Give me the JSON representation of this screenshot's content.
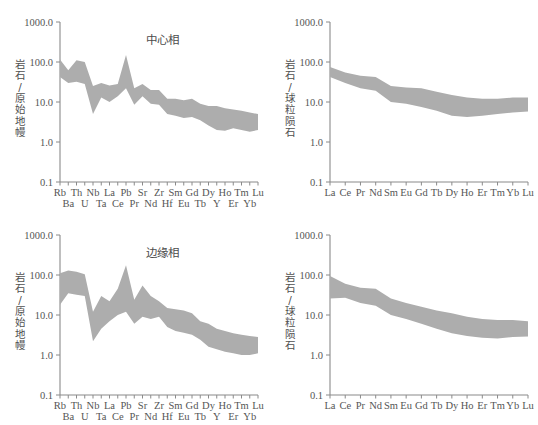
{
  "figure": {
    "background": "#ffffff",
    "band_color": "#adadad",
    "axis_color": "#8a8a8a"
  },
  "panels": [
    {
      "id": "top-left",
      "title": "中心相",
      "ylabel": "岩石/原始地幔",
      "chart_data": {
        "type": "area",
        "title": "中心相",
        "xlabel": "",
        "ylabel": "岩石/原始地幔",
        "ylim": [
          0.1,
          1000.0
        ],
        "yscale": "log",
        "yticks": [
          "1000.0",
          "100.0",
          "10.0",
          "1.0",
          "0.1"
        ],
        "ytick_values": [
          1000.0,
          100.0,
          10.0,
          1.0,
          0.1
        ],
        "grid": false,
        "legend": "none",
        "categories": [
          "Rb",
          "Ba",
          "Th",
          "U",
          "Nb",
          "Ta",
          "La",
          "Ce",
          "Pb",
          "Pr",
          "Sr",
          "Nd",
          "Zr",
          "Hf",
          "Sm",
          "Eu",
          "Gd",
          "Tb",
          "Dy",
          "Y",
          "Ho",
          "Er",
          "Tm",
          "Yb",
          "Lu"
        ],
        "xtick_rows": [
          [
            "Rb",
            "Th",
            "Nb",
            "La",
            "Pb",
            "Sr",
            "Zr",
            "Sm",
            "Gd",
            "Dy",
            "Ho",
            "Tm",
            "Lu"
          ],
          [
            "Ba",
            "U",
            "Ta",
            "Ce",
            "Pr",
            "Nd",
            "Hf",
            "Eu",
            "Tb",
            "Y",
            "Er",
            "Yb"
          ]
        ],
        "series": [
          {
            "name": "upper",
            "values": [
              115,
              62,
              110,
              100,
              25,
              30,
              26,
              28,
              150,
              22,
              28,
              20,
              20,
              12,
              12,
              11,
              12,
              9.0,
              8.0,
              8.0,
              7.0,
              6.5,
              6.0,
              5.5,
              5.0
            ]
          },
          {
            "name": "lower",
            "values": [
              42,
              30,
              32,
              28,
              5.0,
              13,
              10,
              14,
              22,
              8.5,
              14,
              9.0,
              8.5,
              5.0,
              4.5,
              4.0,
              4.2,
              3.5,
              2.6,
              2.0,
              1.9,
              2.2,
              2.0,
              1.8,
              2.0
            ]
          }
        ]
      }
    },
    {
      "id": "top-right",
      "title": "",
      "ylabel": "岩石/球粒陨石",
      "chart_data": {
        "type": "area",
        "title": "",
        "xlabel": "",
        "ylabel": "岩石/球粒陨石",
        "ylim": [
          0.1,
          1000.0
        ],
        "yscale": "log",
        "yticks": [
          "1000.0",
          "100.0",
          "10.0",
          "1.0",
          "0.1"
        ],
        "ytick_values": [
          1000.0,
          100.0,
          10.0,
          1.0,
          0.1
        ],
        "grid": false,
        "legend": "none",
        "categories": [
          "La",
          "Ce",
          "Pr",
          "Nd",
          "Sm",
          "Eu",
          "Gd",
          "Tb",
          "Dy",
          "Ho",
          "Er",
          "Tm",
          "Yb",
          "Lu"
        ],
        "xtick_rows": [
          [
            "La",
            "Ce",
            "Pr",
            "Nd",
            "Sm",
            "Eu",
            "Gd",
            "Tb",
            "Dy",
            "Ho",
            "Er",
            "Tm",
            "Yb",
            "Lu"
          ]
        ],
        "series": [
          {
            "name": "upper",
            "values": [
              75,
              55,
              45,
              42,
              25,
              23,
              22,
              18,
              15,
              13,
              12,
              12,
              13,
              13
            ]
          },
          {
            "name": "lower",
            "values": [
              42,
              30,
              22,
              19,
              10,
              9.0,
              7.5,
              6.0,
              4.5,
              4.2,
              4.5,
              5.0,
              5.5,
              5.8
            ]
          }
        ]
      }
    },
    {
      "id": "bottom-left",
      "title": "边缘相",
      "ylabel": "岩石/原始地幔",
      "chart_data": {
        "type": "area",
        "title": "边缘相",
        "xlabel": "",
        "ylabel": "岩石/原始地幔",
        "ylim": [
          0.1,
          1000.0
        ],
        "yscale": "log",
        "yticks": [
          "1000.0",
          "100.0",
          "10.0",
          "1.0",
          "0.1"
        ],
        "ytick_values": [
          1000.0,
          100.0,
          10.0,
          1.0,
          0.1
        ],
        "grid": false,
        "legend": "none",
        "categories": [
          "Rb",
          "Ba",
          "Th",
          "U",
          "Nb",
          "Ta",
          "La",
          "Ce",
          "Pb",
          "Pr",
          "Sr",
          "Nd",
          "Zr",
          "Hf",
          "Sm",
          "Eu",
          "Gd",
          "Tb",
          "Dy",
          "Y",
          "Ho",
          "Er",
          "Tm",
          "Yb",
          "Lu"
        ],
        "xtick_rows": [
          [
            "Rb",
            "Th",
            "Nb",
            "La",
            "Pb",
            "Sr",
            "Zr",
            "Sm",
            "Gd",
            "Dy",
            "Ho",
            "Tm",
            "Lu"
          ],
          [
            "Ba",
            "U",
            "Ta",
            "Ce",
            "Pr",
            "Nd",
            "Hf",
            "Eu",
            "Tb",
            "Y",
            "Er",
            "Yb"
          ]
        ],
        "series": [
          {
            "name": "upper",
            "values": [
              110,
              130,
              120,
              105,
              12,
              30,
              22,
              45,
              175,
              24,
              55,
              30,
              22,
              15,
              14,
              13,
              11,
              7.0,
              6.0,
              4.5,
              4.0,
              3.5,
              3.2,
              3.0,
              2.8
            ]
          },
          {
            "name": "lower",
            "values": [
              18,
              35,
              32,
              30,
              2.2,
              4.5,
              7.0,
              10,
              12,
              6.0,
              9.0,
              8.0,
              9.0,
              5.0,
              4.0,
              3.6,
              3.2,
              2.4,
              1.6,
              1.4,
              1.2,
              1.1,
              1.0,
              1.0,
              1.1
            ]
          }
        ]
      }
    },
    {
      "id": "bottom-right",
      "title": "",
      "ylabel": "岩石/球粒陨石",
      "chart_data": {
        "type": "area",
        "title": "",
        "xlabel": "",
        "ylabel": "岩石/球粒陨石",
        "ylim": [
          0.1,
          1000.0
        ],
        "yscale": "log",
        "yticks": [
          "1000.0",
          "100.0",
          "10.0",
          "1.0",
          "0.1"
        ],
        "ytick_values": [
          1000.0,
          100.0,
          10.0,
          1.0,
          0.1
        ],
        "grid": false,
        "legend": "none",
        "categories": [
          "La",
          "Ce",
          "Pr",
          "Nd",
          "Sm",
          "Eu",
          "Gd",
          "Tb",
          "Dy",
          "Ho",
          "Er",
          "Tm",
          "Yb",
          "Lu"
        ],
        "xtick_rows": [
          [
            "La",
            "Ce",
            "Pr",
            "Nd",
            "Sm",
            "Eu",
            "Gd",
            "Tb",
            "Dy",
            "Ho",
            "Er",
            "Tm",
            "Yb",
            "Lu"
          ]
        ],
        "series": [
          {
            "name": "upper",
            "values": [
              95,
              60,
              48,
              45,
              26,
              20,
              16,
              13,
              11,
              9.0,
              8.0,
              7.5,
              7.5,
              7.0
            ]
          },
          {
            "name": "lower",
            "values": [
              26,
              27,
              20,
              17,
              10,
              8.0,
              6.0,
              4.5,
              3.5,
              3.0,
              2.7,
              2.6,
              2.8,
              2.9
            ]
          }
        ]
      }
    }
  ]
}
